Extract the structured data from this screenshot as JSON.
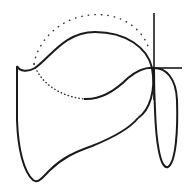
{
  "diagram": {
    "title": "Curve loop sketch with crosshair",
    "stroke_color": "#1a1a1a",
    "background": "#ffffff",
    "elements": [
      {
        "name": "main-closed-curve",
        "style": "solid"
      },
      {
        "name": "upper-arc",
        "style": "solid"
      },
      {
        "name": "right-loop",
        "style": "solid"
      },
      {
        "name": "dotted-arc",
        "style": "dotted"
      },
      {
        "name": "crosshair-vertical",
        "style": "solid"
      },
      {
        "name": "crosshair-horizontal",
        "style": "solid"
      }
    ]
  }
}
